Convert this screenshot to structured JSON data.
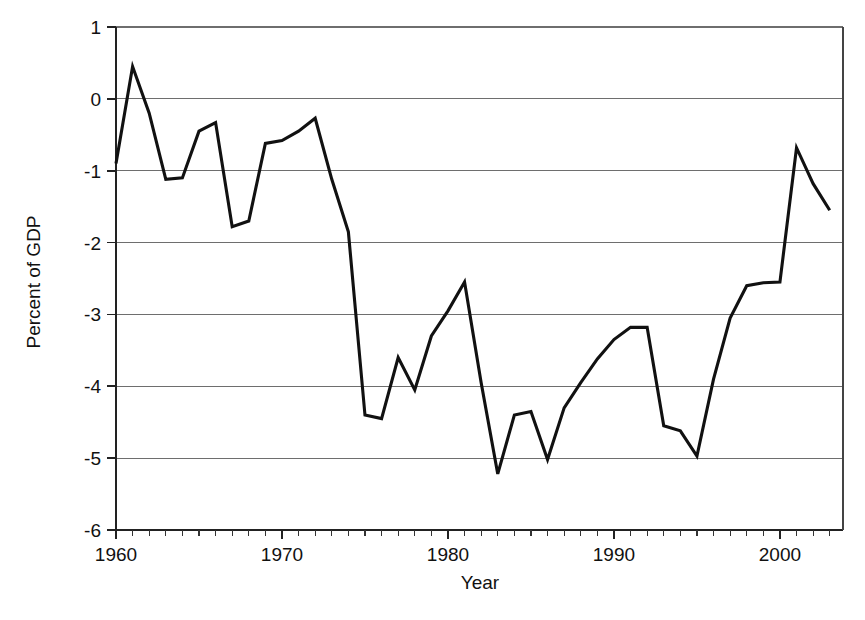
{
  "chart_data": {
    "type": "line",
    "title": "",
    "xlabel": "Year",
    "ylabel": "Percent of GDP",
    "xlim": [
      1960,
      2003.8
    ],
    "ylim": [
      -6,
      1
    ],
    "grid": true,
    "legend": false,
    "legend_position": "none",
    "line_color": "#111111",
    "grid_color": "#6e6e6e",
    "axis_color": "#222222",
    "x_major_ticks": [
      1960,
      1970,
      1980,
      1990,
      2000
    ],
    "x_major_tick_labels": [
      "1960",
      "1970",
      "1980",
      "1990",
      "2000"
    ],
    "x_minor_tick_interval": 1,
    "y_ticks": [
      1,
      0,
      -1,
      -2,
      -3,
      -4,
      -5,
      -6
    ],
    "y_tick_labels": [
      "1",
      "0",
      "-1",
      "-2",
      "-3",
      "-4",
      "-5",
      "-6"
    ],
    "x": [
      1960,
      1961,
      1962,
      1963,
      1964,
      1965,
      1966,
      1967,
      1968,
      1969,
      1970,
      1971,
      1972,
      1973,
      1974,
      1975,
      1976,
      1977,
      1978,
      1979,
      1980,
      1981,
      1982,
      1983,
      1984,
      1985,
      1986,
      1987,
      1988,
      1989,
      1990,
      1991,
      1992,
      1993,
      1994,
      1995,
      1996,
      1997,
      1998,
      1999,
      2000,
      2001,
      2002,
      2003
    ],
    "values": [
      -0.9,
      0.45,
      -0.2,
      -1.12,
      -1.1,
      -0.45,
      -0.33,
      -1.78,
      -1.7,
      -0.62,
      -0.58,
      -0.45,
      -0.27,
      -1.12,
      -1.85,
      -4.4,
      -4.45,
      -3.6,
      -4.05,
      -3.3,
      -2.95,
      -2.55,
      -3.95,
      -5.22,
      -4.4,
      -4.35,
      -5.02,
      -4.3,
      -3.95,
      -3.62,
      -3.35,
      -3.18,
      -3.18,
      -4.55,
      -4.62,
      -4.97,
      -3.9,
      -3.05,
      -2.6,
      -2.56,
      -2.55,
      -0.68,
      -1.18,
      -1.55
    ],
    "series": [
      {
        "name": "Percent of GDP",
        "values": [
          -0.9,
          0.45,
          -0.2,
          -1.12,
          -1.1,
          -0.45,
          -0.33,
          -1.78,
          -1.7,
          -0.62,
          -0.58,
          -0.45,
          -0.27,
          -1.12,
          -1.85,
          -4.4,
          -4.45,
          -3.6,
          -4.05,
          -3.3,
          -2.95,
          -2.55,
          -3.95,
          -5.22,
          -4.4,
          -4.35,
          -5.02,
          -4.3,
          -3.95,
          -3.62,
          -3.35,
          -3.18,
          -3.18,
          -4.55,
          -4.62,
          -4.97,
          -3.9,
          -3.05,
          -2.6,
          -2.56,
          -2.55,
          -0.68,
          -1.18,
          -1.55
        ]
      }
    ]
  }
}
